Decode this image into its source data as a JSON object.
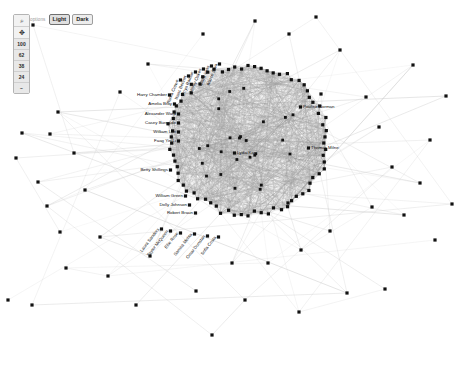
{
  "app": {
    "title": "Network Graph Viewer",
    "background": "#ffffff",
    "node_color": "#111111",
    "edge_color": "#6e6e6e",
    "width": 466,
    "height": 366
  },
  "control_panel": {
    "buttons": [
      {
        "name": "zoom-search-icon",
        "label": "⌕",
        "kind": "icon"
      },
      {
        "name": "pan-move-icon",
        "label": "✥",
        "kind": "icon"
      },
      {
        "name": "zoom-level-100",
        "label": "100",
        "kind": "zoom"
      },
      {
        "name": "zoom-level-62",
        "label": "62",
        "kind": "zoom"
      },
      {
        "name": "zoom-level-38",
        "label": "38",
        "kind": "zoom"
      },
      {
        "name": "zoom-level-24",
        "label": "24",
        "kind": "zoom"
      },
      {
        "name": "zoom-level-more",
        "label": "–",
        "kind": "zoom"
      }
    ]
  },
  "theme_bar": {
    "label": "options",
    "light_label": "Light",
    "dark_label": "Dark",
    "active": "Light"
  },
  "chart_data": {
    "type": "network",
    "node_count": 128,
    "labeled_nodes": [
      {
        "name": "Harry Chamber",
        "x": 167,
        "y": 95,
        "anchor": "right",
        "rotation": 0
      },
      {
        "name": "Amelia Bray",
        "x": 172,
        "y": 104,
        "anchor": "right",
        "rotation": 0
      },
      {
        "name": "Alexander Ward",
        "x": 176,
        "y": 114,
        "anchor": "right",
        "rotation": 0
      },
      {
        "name": "Casey Burnside",
        "x": 176,
        "y": 123,
        "anchor": "right",
        "rotation": 0
      },
      {
        "name": "William Lee",
        "x": 176,
        "y": 132,
        "anchor": "right",
        "rotation": 0
      },
      {
        "name": "Faag Yin Li",
        "x": 176,
        "y": 141,
        "anchor": "right",
        "rotation": 0
      },
      {
        "name": "Betty Shillings",
        "x": 168,
        "y": 170,
        "anchor": "right",
        "rotation": 0
      },
      {
        "name": "William Green",
        "x": 183,
        "y": 196,
        "anchor": "right",
        "rotation": 0
      },
      {
        "name": "Dolly Johnson",
        "x": 187,
        "y": 205,
        "anchor": "right",
        "rotation": 0
      },
      {
        "name": "Robert Braun",
        "x": 193,
        "y": 213,
        "anchor": "right",
        "rotation": 0
      },
      {
        "name": "Lydia Karr",
        "x": 237,
        "y": 153,
        "anchor": "left",
        "rotation": 0
      },
      {
        "name": "Pauline Norman",
        "x": 303,
        "y": 107,
        "anchor": "left",
        "rotation": 0
      },
      {
        "name": "Thomas Milne",
        "x": 311,
        "y": 148,
        "anchor": "left",
        "rotation": 0
      },
      {
        "name": "Laura Sanders",
        "x": 159,
        "y": 229,
        "anchor": "right",
        "rotation": -52
      },
      {
        "name": "Taylor McQueen",
        "x": 168,
        "y": 231,
        "anchor": "right",
        "rotation": -52
      },
      {
        "name": "Ellie Rose",
        "x": 178,
        "y": 233,
        "anchor": "right",
        "rotation": -52
      },
      {
        "name": "Samira Mehta",
        "x": 192,
        "y": 234,
        "anchor": "right",
        "rotation": -52
      },
      {
        "name": "Omar Dunstan",
        "x": 205,
        "y": 236,
        "anchor": "right",
        "rotation": -52
      },
      {
        "name": "Sofia Costa",
        "x": 216,
        "y": 237,
        "anchor": "right",
        "rotation": -52
      },
      {
        "name": "Nadia Crowe",
        "x": 178,
        "y": 80,
        "anchor": "right",
        "rotation": -68
      },
      {
        "name": "Isaac Bennet",
        "x": 186,
        "y": 76,
        "anchor": "right",
        "rotation": -68
      },
      {
        "name": "Priya Raman",
        "x": 193,
        "y": 72,
        "anchor": "right",
        "rotation": -68
      },
      {
        "name": "Henry Oakes",
        "x": 201,
        "y": 69,
        "anchor": "right",
        "rotation": -68
      },
      {
        "name": "Clara Voss",
        "x": 209,
        "y": 66,
        "anchor": "right",
        "rotation": -68
      },
      {
        "name": "Marco Silva",
        "x": 217,
        "y": 64,
        "anchor": "right",
        "rotation": -68
      }
    ],
    "hub_center": {
      "x": 248,
      "y": 140,
      "radius": 78
    },
    "legend": [],
    "grid": false
  }
}
